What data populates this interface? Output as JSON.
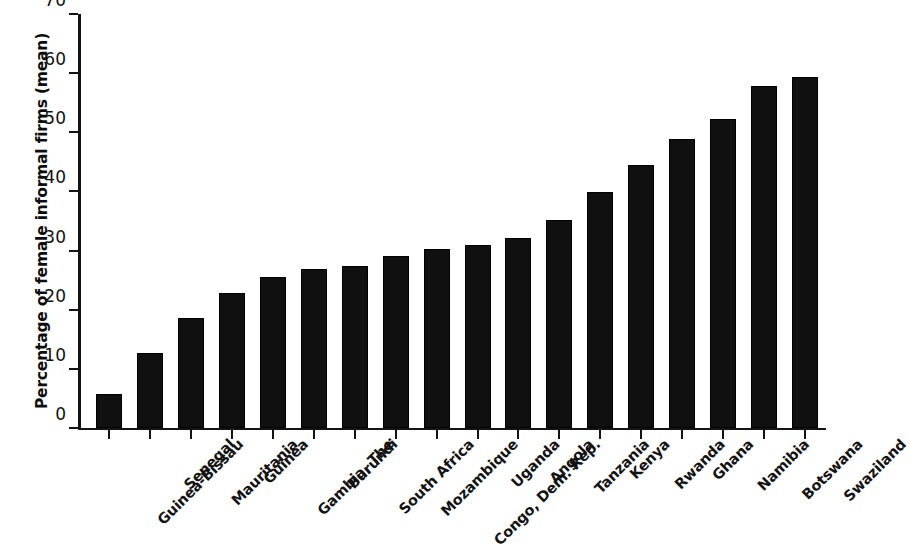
{
  "chart_data": {
    "type": "bar",
    "title": "",
    "xlabel": "",
    "ylabel": "Percentage of female informal firms (mean)",
    "ylim": [
      0,
      70
    ],
    "yticks": [
      0,
      10,
      20,
      30,
      40,
      50,
      60,
      70
    ],
    "grid": false,
    "legend": null,
    "orientation": "vertical",
    "bar_color": "#101010",
    "categories": [
      "Guinea-Bissau",
      "Senegal",
      "Mauritania",
      "Guinea",
      "Gambia, The",
      "Burundi",
      "South Africa",
      "Mozambique",
      "Congo, Dem. Rep.",
      "Uganda",
      "Angola",
      "Tanzania",
      "Kenya",
      "Rwanda",
      "Ghana",
      "Namibia",
      "Botswana",
      "Swaziland"
    ],
    "values": [
      5.8,
      12.6,
      18.6,
      22.9,
      25.5,
      26.9,
      27.4,
      29.1,
      30.3,
      30.9,
      32.1,
      35.2,
      39.9,
      44.4,
      48.9,
      52.3,
      57.9,
      59.4
    ]
  }
}
